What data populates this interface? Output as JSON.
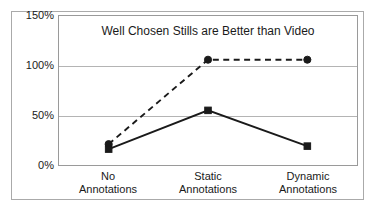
{
  "chart_data": {
    "type": "line",
    "title": "Well Chosen Stills are Better than Video",
    "xlabel": "",
    "ylabel": "",
    "ylim": [
      0,
      150
    ],
    "yticks": [
      0,
      50,
      100,
      150
    ],
    "ytick_labels": [
      "0%",
      "50%",
      "100%",
      "150%"
    ],
    "grid": true,
    "legend": "none",
    "categories": [
      "No Annotations",
      "Static Annotations",
      "Dynamic Annotations"
    ],
    "category_lines": [
      {
        "line1": "No",
        "line2": "Annotations"
      },
      {
        "line1": "Static",
        "line2": "Annotations"
      },
      {
        "line1": "Dynamic",
        "line2": "Annotations"
      }
    ],
    "series": [
      {
        "name": "stills",
        "marker": "circle",
        "linestyle": "dashed",
        "color": "#1a1a1a",
        "values": [
          21,
          106,
          106
        ]
      },
      {
        "name": "video",
        "marker": "square",
        "linestyle": "solid",
        "color": "#1a1a1a",
        "values": [
          16,
          55,
          19
        ]
      }
    ]
  },
  "colors": {
    "frame_border": "#aaaaaa",
    "axis": "#9a9a9a",
    "gridline": "#b4b4b4",
    "text": "#1a1a1a",
    "background": "#ffffff"
  }
}
